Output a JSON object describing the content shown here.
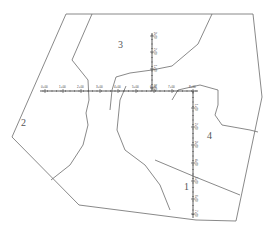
{
  "map": {
    "colors": {
      "line": "#6b6b6b",
      "axis": "#333333",
      "label": "#555555",
      "background": "#ffffff"
    },
    "boundary": [
      [
        66,
        14
      ],
      [
        253,
        14
      ],
      [
        262,
        97
      ],
      [
        236,
        221
      ],
      [
        196,
        220
      ],
      [
        79,
        205
      ],
      [
        12,
        137
      ]
    ],
    "division_lines": [
      {
        "id": "line-2-3",
        "points": [
          [
            92,
            14
          ],
          [
            72,
            60
          ],
          [
            88,
            80
          ],
          [
            89,
            100
          ],
          [
            86,
            113
          ],
          [
            88,
            125
          ],
          [
            83,
            145
          ],
          [
            70,
            165
          ],
          [
            51,
            180
          ]
        ]
      },
      {
        "id": "line-3-4",
        "points": [
          [
            212,
            14
          ],
          [
            198,
            44
          ],
          [
            172,
            66
          ],
          [
            152,
            70
          ],
          [
            130,
            73
          ],
          [
            116,
            77
          ],
          [
            112,
            90
          ],
          [
            110,
            110
          ]
        ]
      },
      {
        "id": "line-1-3",
        "points": [
          [
            126,
            86
          ],
          [
            120,
            100
          ],
          [
            117,
            130
          ],
          [
            125,
            150
          ],
          [
            145,
            165
          ],
          [
            160,
            185
          ],
          [
            170,
            210
          ]
        ]
      },
      {
        "id": "line-4-inner",
        "points": [
          [
            172,
            100
          ],
          [
            178,
            90
          ],
          [
            200,
            85
          ],
          [
            218,
            90
          ],
          [
            218,
            105
          ],
          [
            215,
            115
          ],
          [
            222,
            125
          ],
          [
            250,
            130
          ],
          [
            258,
            132
          ]
        ]
      },
      {
        "id": "line-1-4",
        "points": [
          [
            155,
            160
          ],
          [
            193,
            176
          ],
          [
            240,
            195
          ]
        ]
      }
    ],
    "parcels": [
      {
        "id": "1",
        "label": "1",
        "x": 184,
        "y": 182
      },
      {
        "id": "2",
        "label": "2",
        "x": 21,
        "y": 118
      },
      {
        "id": "3",
        "label": "3",
        "x": 118,
        "y": 40
      },
      {
        "id": "4",
        "label": "4",
        "x": 207,
        "y": 131
      }
    ],
    "axes": {
      "horizontal": {
        "y": 91,
        "x_start": 40,
        "x_end": 198,
        "ticks": [
          {
            "x": 45,
            "label": "0+00"
          },
          {
            "x": 63,
            "label": "1+00"
          },
          {
            "x": 81,
            "label": "2+00"
          },
          {
            "x": 100,
            "label": "3+00"
          },
          {
            "x": 118,
            "label": "4+00"
          },
          {
            "x": 136,
            "label": "5+00"
          },
          {
            "x": 154,
            "label": "6+00"
          },
          {
            "x": 172,
            "label": "7+00"
          },
          {
            "x": 193,
            "label": "8+00"
          }
        ]
      },
      "vertical_upper": {
        "x": 152,
        "y_start": 33,
        "y_end": 91,
        "ticks": [
          {
            "y": 36,
            "label": "3+00"
          },
          {
            "y": 52,
            "label": "2+00"
          },
          {
            "y": 69,
            "label": "1+00"
          },
          {
            "y": 88,
            "label": "0+00"
          }
        ]
      },
      "vertical_lower": {
        "x": 193,
        "y_start": 91,
        "y_end": 218,
        "ticks": [
          {
            "y": 108,
            "label": "1+00"
          },
          {
            "y": 127,
            "label": "2+00"
          },
          {
            "y": 145,
            "label": "3+00"
          },
          {
            "y": 163,
            "label": "4+00"
          },
          {
            "y": 181,
            "label": "5+00"
          },
          {
            "y": 199,
            "label": "6+00"
          },
          {
            "y": 214,
            "label": "7+00"
          }
        ]
      }
    }
  }
}
